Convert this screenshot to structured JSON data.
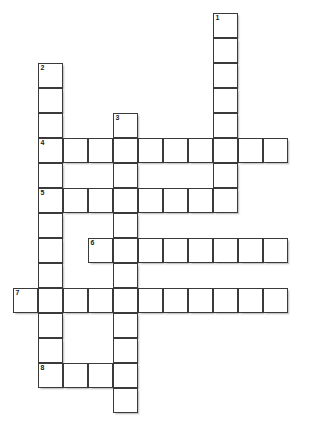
{
  "puzzle": {
    "title": "Crossword Puzzle Grid",
    "type": "crossword-grid",
    "grid": {
      "cell_size": 25,
      "origin_x": 13,
      "origin_y": 13,
      "cols": 12,
      "rows": 17,
      "cell_fill_color": "#ffffff",
      "cell_border_color": "#3a3a3a",
      "background_color": "#ffffff"
    },
    "entries": [
      {
        "number": "1",
        "direction": "down",
        "start_col": 8,
        "start_row": 0,
        "length": 8
      },
      {
        "number": "2",
        "direction": "down",
        "start_col": 1,
        "start_row": 2,
        "length": 13
      },
      {
        "number": "3",
        "direction": "down",
        "start_col": 4,
        "start_row": 4,
        "length": 12
      },
      {
        "number": "4",
        "direction": "across",
        "start_col": 1,
        "start_row": 5,
        "length": 10
      },
      {
        "number": "5",
        "direction": "across",
        "start_col": 1,
        "start_row": 7,
        "length": 8
      },
      {
        "number": "6",
        "direction": "across",
        "start_col": 3,
        "start_row": 9,
        "length": 8
      },
      {
        "number": "7",
        "direction": "across",
        "start_col": 0,
        "start_row": 11,
        "length": 11
      },
      {
        "number": "8",
        "direction": "across",
        "start_col": 1,
        "start_row": 14,
        "length": 3
      }
    ],
    "cells": [
      {
        "col": 8,
        "row": 0,
        "number": "1"
      },
      {
        "col": 8,
        "row": 1,
        "number": ""
      },
      {
        "col": 8,
        "row": 2,
        "number": ""
      },
      {
        "col": 8,
        "row": 3,
        "number": ""
      },
      {
        "col": 8,
        "row": 4,
        "number": ""
      },
      {
        "col": 1,
        "row": 2,
        "number": "2"
      },
      {
        "col": 1,
        "row": 3,
        "number": ""
      },
      {
        "col": 1,
        "row": 4,
        "number": ""
      },
      {
        "col": 4,
        "row": 4,
        "number": "3"
      },
      {
        "col": 1,
        "row": 5,
        "number": "4"
      },
      {
        "col": 2,
        "row": 5,
        "number": ""
      },
      {
        "col": 3,
        "row": 5,
        "number": ""
      },
      {
        "col": 4,
        "row": 5,
        "number": ""
      },
      {
        "col": 5,
        "row": 5,
        "number": ""
      },
      {
        "col": 6,
        "row": 5,
        "number": ""
      },
      {
        "col": 7,
        "row": 5,
        "number": ""
      },
      {
        "col": 8,
        "row": 5,
        "number": ""
      },
      {
        "col": 9,
        "row": 5,
        "number": ""
      },
      {
        "col": 10,
        "row": 5,
        "number": ""
      },
      {
        "col": 1,
        "row": 6,
        "number": ""
      },
      {
        "col": 4,
        "row": 6,
        "number": ""
      },
      {
        "col": 8,
        "row": 6,
        "number": ""
      },
      {
        "col": 1,
        "row": 7,
        "number": "5"
      },
      {
        "col": 2,
        "row": 7,
        "number": ""
      },
      {
        "col": 3,
        "row": 7,
        "number": ""
      },
      {
        "col": 4,
        "row": 7,
        "number": ""
      },
      {
        "col": 5,
        "row": 7,
        "number": ""
      },
      {
        "col": 6,
        "row": 7,
        "number": ""
      },
      {
        "col": 7,
        "row": 7,
        "number": ""
      },
      {
        "col": 8,
        "row": 7,
        "number": ""
      },
      {
        "col": 1,
        "row": 8,
        "number": ""
      },
      {
        "col": 4,
        "row": 8,
        "number": ""
      },
      {
        "col": 1,
        "row": 9,
        "number": ""
      },
      {
        "col": 3,
        "row": 9,
        "number": "6"
      },
      {
        "col": 4,
        "row": 9,
        "number": ""
      },
      {
        "col": 5,
        "row": 9,
        "number": ""
      },
      {
        "col": 6,
        "row": 9,
        "number": ""
      },
      {
        "col": 7,
        "row": 9,
        "number": ""
      },
      {
        "col": 8,
        "row": 9,
        "number": ""
      },
      {
        "col": 9,
        "row": 9,
        "number": ""
      },
      {
        "col": 10,
        "row": 9,
        "number": ""
      },
      {
        "col": 1,
        "row": 10,
        "number": ""
      },
      {
        "col": 4,
        "row": 10,
        "number": ""
      },
      {
        "col": 0,
        "row": 11,
        "number": "7"
      },
      {
        "col": 1,
        "row": 11,
        "number": ""
      },
      {
        "col": 2,
        "row": 11,
        "number": ""
      },
      {
        "col": 3,
        "row": 11,
        "number": ""
      },
      {
        "col": 4,
        "row": 11,
        "number": ""
      },
      {
        "col": 5,
        "row": 11,
        "number": ""
      },
      {
        "col": 6,
        "row": 11,
        "number": ""
      },
      {
        "col": 7,
        "row": 11,
        "number": ""
      },
      {
        "col": 8,
        "row": 11,
        "number": ""
      },
      {
        "col": 9,
        "row": 11,
        "number": ""
      },
      {
        "col": 10,
        "row": 11,
        "number": ""
      },
      {
        "col": 1,
        "row": 12,
        "number": ""
      },
      {
        "col": 4,
        "row": 12,
        "number": ""
      },
      {
        "col": 1,
        "row": 13,
        "number": ""
      },
      {
        "col": 4,
        "row": 13,
        "number": ""
      },
      {
        "col": 1,
        "row": 14,
        "number": "8"
      },
      {
        "col": 2,
        "row": 14,
        "number": ""
      },
      {
        "col": 3,
        "row": 14,
        "number": ""
      },
      {
        "col": 4,
        "row": 14,
        "number": ""
      },
      {
        "col": 4,
        "row": 15,
        "number": ""
      }
    ]
  }
}
